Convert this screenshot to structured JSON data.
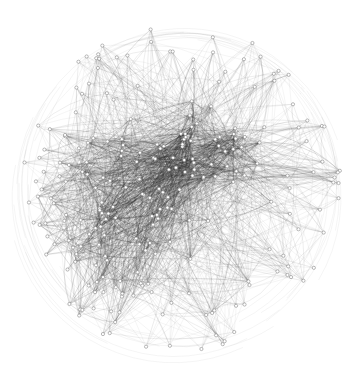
{
  "figure": {
    "type": "network-graph",
    "width": 354,
    "height": 375,
    "background": "#ffffff",
    "edge_color": "#3a3a3a",
    "node_fill": "#ffffff",
    "node_stroke": "#8a8a8a",
    "boundary": {
      "cx": 180,
      "cy": 190,
      "r": 165
    },
    "hubs": [
      {
        "name": "primary-hub",
        "cx": 205,
        "cy": 150,
        "spread": 28,
        "node_count": 40,
        "density": 1.0
      },
      {
        "name": "secondary-cluster",
        "cx": 125,
        "cy": 220,
        "spread": 55,
        "node_count": 95,
        "density": 0.75
      }
    ],
    "peripheral_node_count": 110,
    "edges_per_node": 7,
    "seed": 1337
  }
}
